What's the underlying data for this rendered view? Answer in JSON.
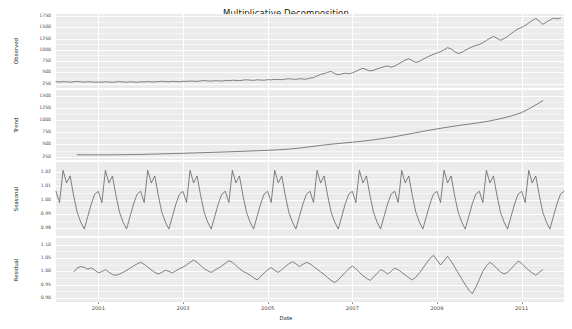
{
  "chart_data": {
    "type": "line",
    "title": "Multiplicative Decomposition",
    "xlabel": "Date",
    "grid": true,
    "legend": "none",
    "x_tick_labels": [
      "2001",
      "2003",
      "2005",
      "2007",
      "2009",
      "2011"
    ],
    "x_tick_values": [
      2001,
      2003,
      2005,
      2007,
      2009,
      2011
    ],
    "xlim": [
      2000.0,
      2012.0
    ],
    "panels": [
      {
        "name": "observed",
        "ylabel": "Observed",
        "ylim": [
          150,
          1800
        ],
        "y_tick_labels": [
          "1750",
          "1500",
          "1250",
          "1000",
          "750",
          "500",
          "250"
        ],
        "y_tick_values": [
          1750,
          1500,
          1250,
          1000,
          750,
          500,
          250
        ],
        "x": [
          2000.0,
          2000.083,
          2000.167,
          2000.25,
          2000.333,
          2000.417,
          2000.5,
          2000.583,
          2000.667,
          2000.75,
          2000.833,
          2000.917,
          2001.0,
          2001.083,
          2001.167,
          2001.25,
          2001.333,
          2001.417,
          2001.5,
          2001.583,
          2001.667,
          2001.75,
          2001.833,
          2001.917,
          2002.0,
          2002.083,
          2002.167,
          2002.25,
          2002.333,
          2002.417,
          2002.5,
          2002.583,
          2002.667,
          2002.75,
          2002.833,
          2002.917,
          2003.0,
          2003.083,
          2003.167,
          2003.25,
          2003.333,
          2003.417,
          2003.5,
          2003.583,
          2003.667,
          2003.75,
          2003.833,
          2003.917,
          2004.0,
          2004.083,
          2004.167,
          2004.25,
          2004.333,
          2004.417,
          2004.5,
          2004.583,
          2004.667,
          2004.75,
          2004.833,
          2004.917,
          2005.0,
          2005.083,
          2005.167,
          2005.25,
          2005.333,
          2005.417,
          2005.5,
          2005.583,
          2005.667,
          2005.75,
          2005.833,
          2005.917,
          2006.0,
          2006.083,
          2006.167,
          2006.25,
          2006.333,
          2006.417,
          2006.5,
          2006.583,
          2006.667,
          2006.75,
          2006.833,
          2006.917,
          2007.0,
          2007.083,
          2007.167,
          2007.25,
          2007.333,
          2007.417,
          2007.5,
          2007.583,
          2007.667,
          2007.75,
          2007.833,
          2007.917,
          2008.0,
          2008.083,
          2008.167,
          2008.25,
          2008.333,
          2008.417,
          2008.5,
          2008.583,
          2008.667,
          2008.75,
          2008.833,
          2008.917,
          2009.0,
          2009.083,
          2009.167,
          2009.25,
          2009.333,
          2009.417,
          2009.5,
          2009.583,
          2009.667,
          2009.75,
          2009.833,
          2009.917,
          2010.0,
          2010.083,
          2010.167,
          2010.25,
          2010.333,
          2010.417,
          2010.5,
          2010.583,
          2010.667,
          2010.75,
          2010.833,
          2010.917,
          2011.0,
          2011.083,
          2011.167,
          2011.25,
          2011.333,
          2011.417,
          2011.5,
          2011.583,
          2011.667,
          2011.75,
          2011.833,
          2011.917
        ],
        "y": [
          290,
          283,
          292,
          287,
          281,
          290,
          296,
          288,
          282,
          291,
          286,
          280,
          284,
          279,
          288,
          283,
          277,
          286,
          292,
          285,
          279,
          289,
          284,
          278,
          288,
          284,
          293,
          289,
          285,
          294,
          300,
          293,
          288,
          298,
          294,
          289,
          300,
          296,
          306,
          302,
          298,
          308,
          315,
          308,
          303,
          313,
          309,
          304,
          316,
          312,
          323,
          319,
          315,
          326,
          333,
          326,
          321,
          332,
          328,
          323,
          336,
          332,
          344,
          340,
          336,
          348,
          356,
          349,
          344,
          356,
          352,
          347,
          372,
          380,
          420,
          452,
          470,
          500,
          520,
          470,
          445,
          465,
          480,
          470,
          486,
          520,
          560,
          590,
          560,
          530,
          545,
          575,
          600,
          625,
          640,
          615,
          640,
          680,
          730,
          775,
          800,
          760,
          720,
          745,
          790,
          830,
          870,
          900,
          930,
          960,
          1000,
          1050,
          1020,
          960,
          920,
          945,
          990,
          1030,
          1070,
          1100,
          1120,
          1160,
          1210,
          1260,
          1300,
          1260,
          1215,
          1250,
          1300,
          1360,
          1420,
          1470,
          1500,
          1545,
          1600,
          1655,
          1700,
          1640,
          1570,
          1620,
          1665,
          1710,
          1690,
          1710
        ]
      },
      {
        "name": "trend",
        "ylabel": "Trend",
        "ylim": [
          180,
          1620
        ],
        "y_tick_labels": [
          "1500",
          "1250",
          "1000",
          "750",
          "500",
          "250"
        ],
        "y_tick_values": [
          1500,
          1250,
          1000,
          750,
          500,
          250
        ],
        "x": [
          2000.5,
          2000.75,
          2001.0,
          2001.25,
          2001.5,
          2001.75,
          2002.0,
          2002.25,
          2002.5,
          2002.75,
          2003.0,
          2003.25,
          2003.5,
          2003.75,
          2004.0,
          2004.25,
          2004.5,
          2004.75,
          2005.0,
          2005.25,
          2005.5,
          2005.75,
          2006.0,
          2006.25,
          2006.5,
          2006.75,
          2007.0,
          2007.25,
          2007.5,
          2007.75,
          2008.0,
          2008.25,
          2008.5,
          2008.75,
          2009.0,
          2009.25,
          2009.5,
          2009.75,
          2010.0,
          2010.25,
          2010.5,
          2010.75,
          2011.0,
          2011.25,
          2011.5
        ],
        "y": [
          287,
          286,
          285,
          286,
          288,
          291,
          295,
          300,
          306,
          312,
          318,
          325,
          332,
          339,
          346,
          354,
          362,
          370,
          379,
          390,
          404,
          425,
          452,
          480,
          505,
          525,
          545,
          568,
          595,
          625,
          660,
          700,
          742,
          782,
          820,
          855,
          888,
          918,
          948,
          985,
          1030,
          1085,
          1155,
          1270,
          1400
        ]
      },
      {
        "name": "seasonal",
        "ylabel": "Seasonal",
        "ylim": [
          0.974,
          1.027
        ],
        "y_tick_labels": [
          "1.02",
          "1.01",
          "1.00",
          "0.99",
          "0.98"
        ],
        "y_tick_values": [
          1.02,
          1.01,
          1.0,
          0.99,
          0.98
        ],
        "period": 12,
        "cycle_values": [
          1.006,
          0.998,
          1.021,
          1.012,
          1.017,
          1.003,
          0.991,
          0.984,
          0.979,
          0.988,
          0.997,
          1.004
        ],
        "cycle_months": [
          "Jan",
          "Feb",
          "Mar",
          "Apr",
          "May",
          "Jun",
          "Jul",
          "Aug",
          "Sep",
          "Oct",
          "Nov",
          "Dec"
        ],
        "x_start": 2000.0,
        "x_end": 2012.0
      },
      {
        "name": "residual",
        "ylabel": "Residual",
        "ylim": [
          0.885,
          1.125
        ],
        "y_tick_labels": [
          "1.10",
          "1.05",
          "1.00",
          "0.95",
          "0.90"
        ],
        "y_tick_values": [
          1.1,
          1.05,
          1.0,
          0.95,
          0.9
        ],
        "x": [
          2000.42,
          2000.5,
          2000.583,
          2000.667,
          2000.75,
          2000.833,
          2000.917,
          2001.0,
          2001.083,
          2001.167,
          2001.25,
          2001.333,
          2001.417,
          2001.5,
          2001.583,
          2001.667,
          2001.75,
          2001.833,
          2001.917,
          2002.0,
          2002.083,
          2002.167,
          2002.25,
          2002.333,
          2002.417,
          2002.5,
          2002.583,
          2002.667,
          2002.75,
          2002.833,
          2002.917,
          2003.0,
          2003.083,
          2003.167,
          2003.25,
          2003.333,
          2003.417,
          2003.5,
          2003.583,
          2003.667,
          2003.75,
          2003.833,
          2003.917,
          2004.0,
          2004.083,
          2004.167,
          2004.25,
          2004.333,
          2004.417,
          2004.5,
          2004.583,
          2004.667,
          2004.75,
          2004.833,
          2004.917,
          2005.0,
          2005.083,
          2005.167,
          2005.25,
          2005.333,
          2005.417,
          2005.5,
          2005.583,
          2005.667,
          2005.75,
          2005.833,
          2005.917,
          2006.0,
          2006.083,
          2006.167,
          2006.25,
          2006.333,
          2006.417,
          2006.5,
          2006.583,
          2006.667,
          2006.75,
          2006.833,
          2006.917,
          2007.0,
          2007.083,
          2007.167,
          2007.25,
          2007.333,
          2007.417,
          2007.5,
          2007.583,
          2007.667,
          2007.75,
          2007.833,
          2007.917,
          2008.0,
          2008.083,
          2008.167,
          2008.25,
          2008.333,
          2008.417,
          2008.5,
          2008.583,
          2008.667,
          2008.75,
          2008.833,
          2008.917,
          2009.0,
          2009.083,
          2009.167,
          2009.25,
          2009.333,
          2009.417,
          2009.5,
          2009.583,
          2009.667,
          2009.75,
          2009.833,
          2009.917,
          2010.0,
          2010.083,
          2010.167,
          2010.25,
          2010.333,
          2010.417,
          2010.5,
          2010.583,
          2010.667,
          2010.75,
          2010.833,
          2010.917,
          2011.0,
          2011.083,
          2011.167,
          2011.25,
          2011.333,
          2011.417,
          2011.5
        ],
        "y": [
          0.998,
          1.012,
          1.018,
          1.015,
          1.008,
          1.013,
          1.005,
          0.994,
          0.999,
          1.006,
          0.997,
          0.988,
          0.985,
          0.99,
          0.996,
          1.004,
          1.012,
          1.02,
          1.028,
          1.034,
          1.026,
          1.016,
          1.006,
          0.996,
          0.99,
          0.996,
          1.004,
          1.0,
          0.994,
          1.002,
          1.01,
          1.016,
          1.024,
          1.034,
          1.042,
          1.034,
          1.022,
          1.01,
          1.002,
          0.996,
          1.004,
          1.012,
          1.02,
          1.03,
          1.04,
          1.034,
          1.022,
          1.01,
          1.0,
          0.994,
          0.986,
          0.976,
          0.968,
          0.98,
          0.994,
          1.006,
          1.014,
          1.004,
          0.996,
          1.006,
          1.018,
          1.028,
          1.036,
          1.028,
          1.018,
          1.026,
          1.034,
          1.028,
          1.018,
          1.008,
          0.998,
          0.988,
          0.976,
          0.966,
          0.958,
          0.968,
          0.982,
          0.996,
          1.01,
          1.02,
          1.01,
          0.996,
          0.984,
          0.974,
          0.966,
          0.978,
          0.992,
          1.006,
          1.0,
          0.99,
          1.0,
          1.012,
          1.006,
          0.996,
          0.986,
          0.976,
          0.968,
          0.978,
          0.994,
          1.012,
          1.03,
          1.048,
          1.06,
          1.042,
          1.024,
          1.04,
          1.056,
          1.038,
          1.016,
          0.994,
          0.972,
          0.95,
          0.93,
          0.916,
          0.94,
          0.97,
          1.0,
          1.02,
          1.034,
          1.024,
          1.01,
          0.998,
          0.99,
          0.996,
          1.01,
          1.024,
          1.038,
          1.03,
          1.016,
          1.004,
          0.994,
          0.986,
          0.996,
          1.006
        ]
      }
    ]
  }
}
